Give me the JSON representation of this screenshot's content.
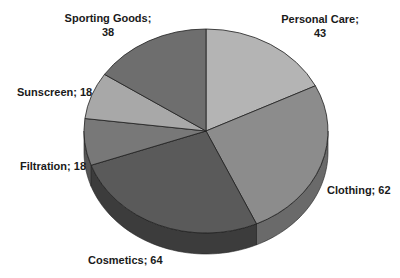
{
  "chart_data": {
    "type": "pie",
    "style": "3d",
    "title": "",
    "start_angle": "12 o'clock, clockwise",
    "categories": [
      "Personal Care",
      "Clothing",
      "Cosmetics",
      "Filtration",
      "Sunscreen",
      "Sporting Goods"
    ],
    "values": [
      43,
      62,
      64,
      18,
      18,
      38
    ],
    "colors": [
      "#b4b4b4",
      "#8c8c8c",
      "#5a5a5a",
      "#787878",
      "#a8a8a8",
      "#6e6e6e"
    ],
    "side_colors": [
      "#8a8a8a",
      "#6a6a6a",
      "#3c3c3c",
      "#555555",
      "#7e7e7e",
      "#4e4e4e"
    ],
    "data_labels": [
      {
        "name": "Personal Care",
        "line1": "Personal Care;",
        "line2": "43"
      },
      {
        "name": "Clothing",
        "line1": "Clothing; 62",
        "line2": ""
      },
      {
        "name": "Cosmetics",
        "line1": "Cosmetics; 64",
        "line2": ""
      },
      {
        "name": "Filtration",
        "line1": "Filtration; 18",
        "line2": ""
      },
      {
        "name": "Sunscreen",
        "line1": "Sunscreen; 18",
        "line2": ""
      },
      {
        "name": "Sporting Goods",
        "line1": "Sporting Goods;",
        "line2": "38"
      }
    ],
    "legend": "none",
    "grid": false
  }
}
